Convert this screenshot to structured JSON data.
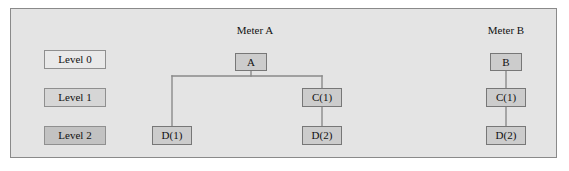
{
  "panel": {
    "background_color": "#e4e4e4",
    "border_color": "#8a8a8a"
  },
  "legend": {
    "items": [
      {
        "label": "Level 0",
        "fill": "#e9e9e9",
        "x": 44,
        "y": 50,
        "w": 62,
        "h": 19
      },
      {
        "label": "Level 1",
        "fill": "#d6d6d6",
        "x": 44,
        "y": 88,
        "w": 62,
        "h": 19
      },
      {
        "label": "Level 2",
        "fill": "#c2c2c2",
        "x": 44,
        "y": 126,
        "w": 62,
        "h": 19
      }
    ]
  },
  "groups": [
    {
      "name": "meter-a",
      "caption": "Meter A",
      "caption_x": 228,
      "caption_y": 25,
      "caption_w": 54
    },
    {
      "name": "meter-b",
      "caption": "Meter B",
      "caption_x": 479,
      "caption_y": 25,
      "caption_w": 54
    }
  ],
  "nodes": [
    {
      "id": "a",
      "label": "A",
      "group": "meter-a",
      "level": 0,
      "x": 235,
      "y": 53,
      "w": 32,
      "h": 18,
      "fill": "#cccccc"
    },
    {
      "id": "a-c1",
      "label": "C(1)",
      "group": "meter-a",
      "level": 1,
      "x": 302,
      "y": 88,
      "w": 40,
      "h": 19,
      "fill": "#cccccc"
    },
    {
      "id": "a-d1",
      "label": "D(1)",
      "group": "meter-a",
      "level": 2,
      "x": 152,
      "y": 126,
      "w": 40,
      "h": 19,
      "fill": "#cccccc"
    },
    {
      "id": "a-d2",
      "label": "D(2)",
      "group": "meter-a",
      "level": 2,
      "x": 302,
      "y": 126,
      "w": 40,
      "h": 19,
      "fill": "#cccccc"
    },
    {
      "id": "b",
      "label": "B",
      "group": "meter-b",
      "level": 0,
      "x": 490,
      "y": 53,
      "w": 32,
      "h": 18,
      "fill": "#cccccc"
    },
    {
      "id": "b-c1",
      "label": "C(1)",
      "group": "meter-b",
      "level": 1,
      "x": 486,
      "y": 88,
      "w": 40,
      "h": 19,
      "fill": "#cccccc"
    },
    {
      "id": "b-d2",
      "label": "D(2)",
      "group": "meter-b",
      "level": 2,
      "x": 486,
      "y": 126,
      "w": 40,
      "h": 19,
      "fill": "#cccccc"
    }
  ],
  "connectors": {
    "color": "#8a8a8a",
    "width": 1.4,
    "paths": [
      "M 251 71 L 251 76",
      "M 172 76 L 322 76",
      "M 172 76 L 172 126",
      "M 322 76 L 322 88",
      "M 322 107 L 322 126",
      "M 506 71 L 506 88",
      "M 506 107 L 506 126"
    ]
  }
}
